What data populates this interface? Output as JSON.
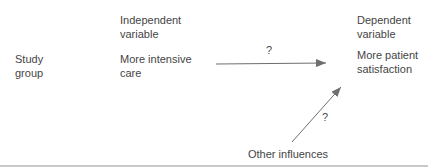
{
  "labels": {
    "study_group": [
      "Study",
      "group"
    ],
    "independent_variable_heading": [
      "Independent",
      "variable"
    ],
    "independent_variable_value": [
      "More intensive",
      "care"
    ],
    "dependent_variable_heading": [
      "Dependent",
      "variable"
    ],
    "dependent_variable_value": [
      "More patient",
      "satisfaction"
    ],
    "other_influences": "Other influences",
    "main_arrow_label": "?",
    "other_influences_arrow_label": "?"
  },
  "colors": {
    "text": "#454545",
    "arrow_line": "#6e6e6e",
    "bottom_rule": "#c9c9c9",
    "background": "#ffffff"
  }
}
